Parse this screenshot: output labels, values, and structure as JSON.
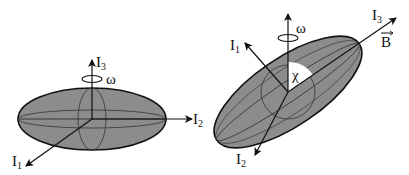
{
  "figure": {
    "left_panel": {
      "description": "Oblate ellipsoid aligned with principal axes, rotating about I3",
      "axes": [
        {
          "name": "I",
          "sub": "3"
        },
        {
          "name": "I",
          "sub": "2"
        },
        {
          "name": "I",
          "sub": "1"
        }
      ],
      "rotation_label": "ω"
    },
    "right_panel": {
      "description": "Tilted ellipsoid with I3 along magnetic field B, angle chi between rotation axis and I3",
      "axes": [
        {
          "name": "I",
          "sub": "3"
        },
        {
          "name": "I",
          "sub": "1"
        },
        {
          "name": "I",
          "sub": "2"
        }
      ],
      "field_label": "B",
      "angle_label": "χ",
      "rotation_label": "ω"
    },
    "colors": {
      "ellipsoid_fill": "#8c8c8c",
      "line": "#111111",
      "angle_wedge": "#ffffff"
    }
  }
}
